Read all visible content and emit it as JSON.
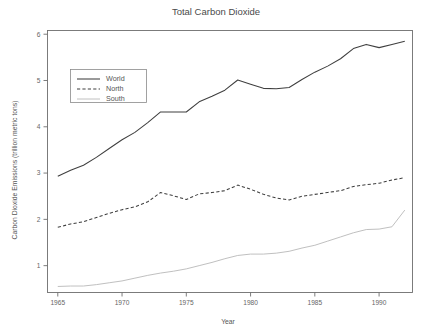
{
  "chart_data": {
    "type": "line",
    "title": "Total Carbon Dioxide",
    "xlabel": "Year",
    "ylabel": "Carbon Dioxide Emissions (trillion metric tons)",
    "xlim": [
      1964.2,
      1992.6
    ],
    "ylim": [
      0.42,
      6.08
    ],
    "xticks": [
      1965,
      1970,
      1975,
      1980,
      1985,
      1990
    ],
    "xtick_labels": [
      "1965",
      "1970",
      "1975",
      "1980",
      "1985",
      "1990"
    ],
    "yticks": [
      1,
      2,
      3,
      4,
      5,
      6
    ],
    "ytick_labels": [
      "1",
      "2",
      "3",
      "4",
      "5",
      "6"
    ],
    "grid": false,
    "legend_position": "upper left",
    "x": [
      1965,
      1966,
      1967,
      1968,
      1969,
      1970,
      1971,
      1972,
      1973,
      1974,
      1975,
      1976,
      1977,
      1978,
      1979,
      1980,
      1981,
      1982,
      1983,
      1984,
      1985,
      1986,
      1987,
      1988,
      1989,
      1990,
      1991,
      1992
    ],
    "series": [
      {
        "name": "World",
        "style": "solid",
        "color": "#3f3f3f",
        "values": [
          2.93,
          3.06,
          3.17,
          3.34,
          3.53,
          3.72,
          3.88,
          4.09,
          4.32,
          4.32,
          4.32,
          4.54,
          4.66,
          4.79,
          5.01,
          4.92,
          4.83,
          4.82,
          4.85,
          5.02,
          5.18,
          5.31,
          5.47,
          5.69,
          5.78,
          5.71,
          5.78,
          5.85
        ]
      },
      {
        "name": "North",
        "style": "dashed",
        "color": "#3f3f3f",
        "values": [
          1.83,
          1.9,
          1.95,
          2.04,
          2.13,
          2.21,
          2.27,
          2.38,
          2.58,
          2.51,
          2.43,
          2.55,
          2.58,
          2.62,
          2.74,
          2.65,
          2.54,
          2.46,
          2.42,
          2.5,
          2.54,
          2.58,
          2.62,
          2.71,
          2.75,
          2.78,
          2.85,
          2.9
        ]
      },
      {
        "name": "South",
        "style": "solid-light",
        "color": "#c0c0c0",
        "values": [
          0.55,
          0.56,
          0.56,
          0.59,
          0.63,
          0.67,
          0.73,
          0.79,
          0.84,
          0.88,
          0.93,
          1.0,
          1.07,
          1.15,
          1.22,
          1.25,
          1.25,
          1.27,
          1.31,
          1.38,
          1.44,
          1.53,
          1.62,
          1.71,
          1.78,
          1.79,
          1.84,
          2.2
        ]
      }
    ],
    "legend_entries": [
      {
        "label": "World",
        "style": "solid"
      },
      {
        "label": "North",
        "style": "dashed"
      },
      {
        "label": "South",
        "style": "solid-light"
      }
    ]
  }
}
